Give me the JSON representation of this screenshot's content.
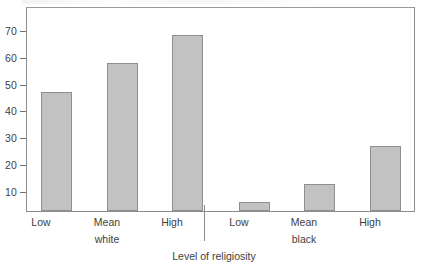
{
  "chart_data": {
    "type": "bar",
    "title": "",
    "xlabel": "Level of religiosity",
    "ylabel": "",
    "categories": [
      "Low",
      "Mean",
      "High",
      "Low",
      "Mean",
      "High"
    ],
    "values": [
      45.8,
      57.0,
      67.5,
      3.3,
      10.5,
      25.0
    ],
    "groups": [
      {
        "name": "white",
        "categories": [
          "Low",
          "Mean",
          "High"
        ],
        "values": [
          45.8,
          57.0,
          67.5
        ]
      },
      {
        "name": "black",
        "categories": [
          "Low",
          "Mean",
          "High"
        ],
        "values": [
          3.3,
          10.5,
          25.0
        ]
      }
    ],
    "ylim": [
      0,
      78
    ],
    "yticks": [
      10,
      20,
      30,
      40,
      50,
      60,
      70
    ],
    "ytick_labels": [
      "10",
      "20",
      "30",
      "40",
      "50",
      "60",
      "70"
    ],
    "grid": false,
    "legend": "none",
    "bar_color": "#c2c2c2",
    "bar_border_color": "#8f8f8f",
    "axis_color": "#8c8c8c"
  },
  "axis": {
    "x_title": "Level of religiosity",
    "ticks": [
      {
        "label": "70"
      },
      {
        "label": "60"
      },
      {
        "label": "50"
      },
      {
        "label": "40"
      },
      {
        "label": "30"
      },
      {
        "label": "20"
      },
      {
        "label": "10"
      }
    ]
  },
  "categories": [
    {
      "label": "Low",
      "sublabel": ""
    },
    {
      "label": "Mean",
      "sublabel": "white"
    },
    {
      "label": "High",
      "sublabel": ""
    },
    {
      "label": "Low",
      "sublabel": ""
    },
    {
      "label": "Mean",
      "sublabel": "black"
    },
    {
      "label": "High",
      "sublabel": ""
    }
  ]
}
